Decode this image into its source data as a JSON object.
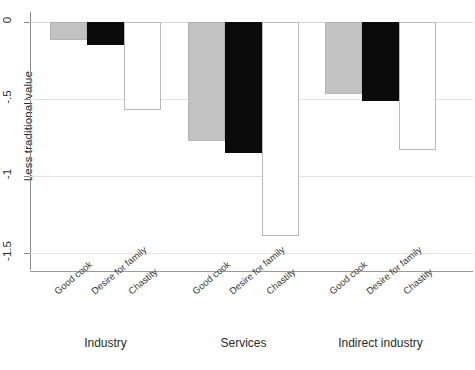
{
  "chart_data": {
    "type": "bar",
    "title": "",
    "xlabel": "",
    "ylabel": "Less traditional value",
    "ylim": [
      -1.6,
      0.05
    ],
    "yticks": [
      0,
      -0.5,
      -1,
      -1.5
    ],
    "ytick_labels": [
      "0",
      "-.5",
      "-1",
      "-1.5"
    ],
    "grid": true,
    "legend": "none",
    "orientation": "vertical",
    "groups": [
      {
        "name": "Industry",
        "categories": [
          "Good cook",
          "Desire for family",
          "Chastity"
        ],
        "values": [
          -0.12,
          -0.15,
          -0.57
        ],
        "styles": [
          "gray",
          "black",
          "white"
        ]
      },
      {
        "name": "Services",
        "categories": [
          "Good cook",
          "Desire for family",
          "Chastity"
        ],
        "values": [
          -0.77,
          -0.85,
          -1.39
        ],
        "styles": [
          "gray",
          "black",
          "white"
        ]
      },
      {
        "name": "Indirect industry",
        "categories": [
          "Good cook",
          "Desire for family",
          "Chastity"
        ],
        "values": [
          -0.47,
          -0.51,
          -0.83
        ],
        "styles": [
          "gray",
          "black",
          "white"
        ]
      }
    ],
    "colors": {
      "gray": "#c2c2c2",
      "black": "#0b0b0b",
      "white": "#ffffff",
      "grid": "#e3e3e3",
      "axis": "#8a8a8a"
    }
  }
}
